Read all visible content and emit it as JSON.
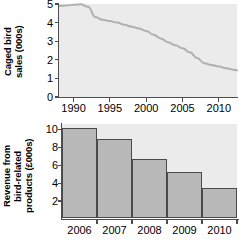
{
  "chart_data": [
    {
      "type": "line",
      "title": "",
      "xlabel": "",
      "ylabel": "Caged bird\nsales (000s)",
      "ylabel_text": "Caged bird sales (000s)",
      "xlim": [
        1988,
        2012.5
      ],
      "ylim": [
        0,
        5
      ],
      "grid": false,
      "legend": "none",
      "line_color": "#b0b0b0",
      "plot_background": "#ebebeb",
      "ytick_labels": [
        "0",
        "1",
        "2",
        "3",
        "4",
        "5"
      ],
      "ytick_values": [
        0,
        1,
        2,
        3,
        4,
        5
      ],
      "xtick_labels": [
        "1990",
        "1995",
        "2000",
        "2005",
        "2010"
      ],
      "xtick_values": [
        1990,
        1995,
        2000,
        2005,
        2010
      ],
      "x": [
        1988,
        1989,
        1990,
        1991,
        1992,
        1993,
        1994,
        1995,
        1996,
        1997,
        1998,
        1999,
        2000,
        2001,
        2002,
        2003,
        2004,
        2005,
        2006,
        2007,
        2008,
        2009,
        2010,
        2011,
        2012,
        2012.5
      ],
      "values": [
        4.9,
        4.92,
        4.96,
        4.98,
        4.85,
        4.3,
        4.15,
        4.08,
        4.0,
        3.88,
        3.78,
        3.68,
        3.55,
        3.35,
        3.15,
        2.95,
        2.78,
        2.62,
        2.4,
        2.1,
        1.82,
        1.72,
        1.64,
        1.55,
        1.47,
        1.44
      ]
    },
    {
      "type": "bar",
      "title": "",
      "xlabel": "",
      "ylabel": "Revenue from\nbird-related\nproducts (£000s)",
      "ylabel_text": "Revenue from bird-related products (£000s)",
      "ylim": [
        0,
        10.6
      ],
      "grid": false,
      "legend": "none",
      "bar_fill": "#b9b9b9",
      "bar_edge": "#4a4a4a",
      "plot_background": "#ebebeb",
      "ytick_labels": [
        "2",
        "4",
        "6",
        "8",
        "10"
      ],
      "ytick_values": [
        2,
        4,
        6,
        8,
        10
      ],
      "categories": [
        "2006",
        "2007",
        "2008",
        "2009",
        "2010"
      ],
      "values": [
        10.0,
        8.8,
        6.6,
        5.1,
        3.4
      ]
    }
  ]
}
